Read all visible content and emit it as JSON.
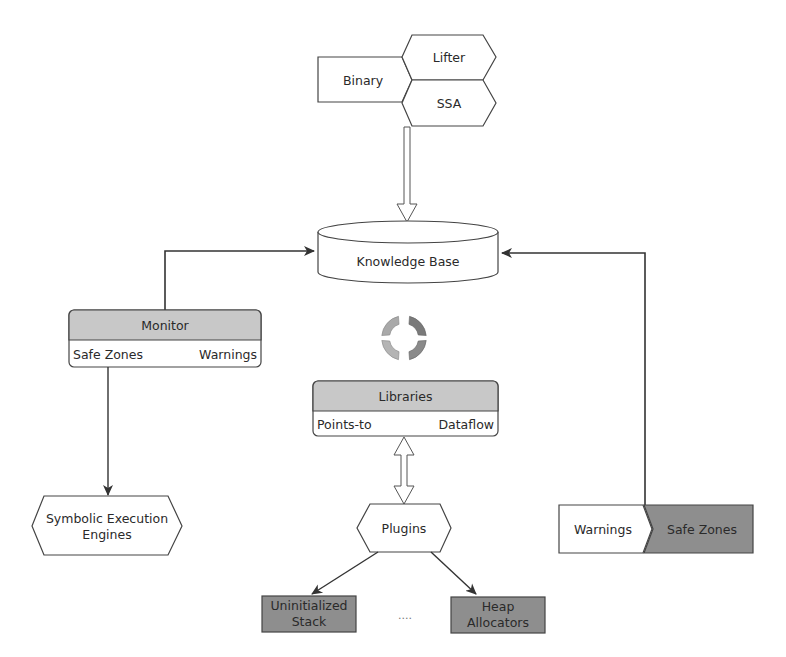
{
  "input": {
    "binary": "Binary",
    "lifter": "Lifter",
    "ssa": "SSA"
  },
  "knowledge_base": {
    "label": "Knowledge Base"
  },
  "monitor": {
    "title": "Monitor",
    "left": "Safe Zones",
    "right": "Warnings"
  },
  "libraries": {
    "title": "Libraries",
    "left": "Points-to",
    "right": "Dataflow"
  },
  "symbolic": {
    "line1": "Symbolic Execution",
    "line2": "Engines"
  },
  "plugins": {
    "label": "Plugins",
    "children": [
      {
        "line1": "Uninitialized",
        "line2": "Stack"
      },
      {
        "line1": "Heap",
        "line2": "Allocators"
      }
    ],
    "ellipsis": "...."
  },
  "output_bar": {
    "left": "Warnings",
    "right": "Safe Zones"
  },
  "colors": {
    "header_gray": "#c8c8c8",
    "dark_gray": "#8e8e8e",
    "stroke": "#333333",
    "cycle_light": "#a9a9a9",
    "cycle_dark": "#7a7a7a"
  }
}
